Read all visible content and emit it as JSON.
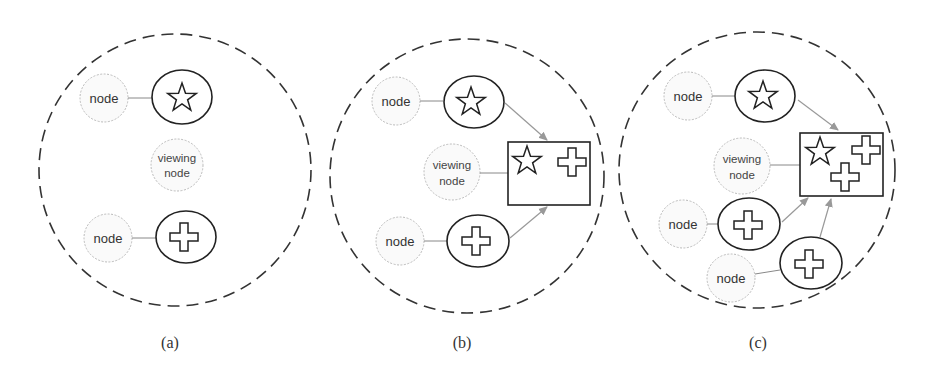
{
  "panels": [
    {
      "id": "a",
      "caption": "(a)",
      "nodes": [
        {
          "label": "node",
          "resource": "star"
        },
        {
          "label": "node",
          "resource": "cross"
        }
      ],
      "viewing_node": {
        "line1": "viewing",
        "line2": "node"
      },
      "cache": []
    },
    {
      "id": "b",
      "caption": "(b)",
      "nodes": [
        {
          "label": "node",
          "resource": "star"
        },
        {
          "label": "node",
          "resource": "cross"
        }
      ],
      "viewing_node": {
        "line1": "viewing",
        "line2": "node"
      },
      "cache": [
        "star",
        "cross"
      ]
    },
    {
      "id": "c",
      "caption": "(c)",
      "nodes": [
        {
          "label": "node",
          "resource": "star"
        },
        {
          "label": "node",
          "resource": "cross"
        },
        {
          "label": "node",
          "resource": "cross"
        }
      ],
      "viewing_node": {
        "line1": "viewing",
        "line2": "node"
      },
      "cache": [
        "star",
        "cross",
        "cross"
      ]
    }
  ],
  "colors": {
    "stroke": "#222222",
    "dashed_boundary": "#333333",
    "node_outline": "#bbbbbb",
    "node_fill": "#fafafa",
    "arrow": "#999999"
  }
}
